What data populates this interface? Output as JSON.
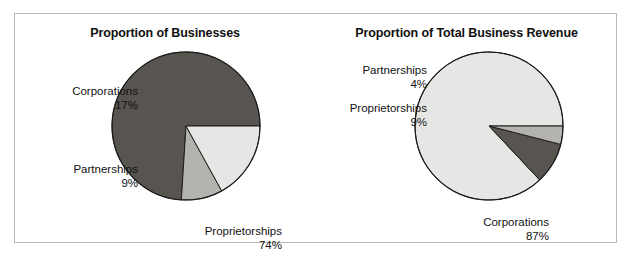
{
  "figure": {
    "background": "#ffffff",
    "frame_color": "#b9b9b9"
  },
  "chart_data": [
    {
      "type": "pie",
      "id": "proportion-of-businesses",
      "title": "Proportion of Businesses",
      "xlabel": "",
      "ylabel": "",
      "legend": "none (direct labels)",
      "grid": false,
      "categories": [
        "Proprietorships",
        "Partnerships",
        "Corporations"
      ],
      "values": [
        74,
        9,
        17
      ],
      "value_labels": [
        "74%",
        "9%",
        "17%"
      ],
      "units": "percent",
      "colors": [
        "#585450",
        "#b5b3b0",
        "#e6e6e4"
      ],
      "slices": [
        {
          "label": "Proprietorships",
          "value": 74,
          "value_label": "74%",
          "color": "#585450"
        },
        {
          "label": "Partnerships",
          "value": 9,
          "value_label": "9%",
          "color": "#b5b3b0"
        },
        {
          "label": "Corporations",
          "value": 17,
          "value_label": "17%",
          "color": "#e6e6e4"
        }
      ]
    },
    {
      "type": "pie",
      "id": "proportion-of-total-business-revenue",
      "title": "Proportion of Total Business Revenue",
      "xlabel": "",
      "ylabel": "",
      "legend": "none (direct labels)",
      "grid": false,
      "categories": [
        "Corporations",
        "Proprietorships",
        "Partnerships"
      ],
      "values": [
        87,
        9,
        4
      ],
      "value_labels": [
        "87%",
        "9%",
        "4%"
      ],
      "units": "percent",
      "colors": [
        "#e6e6e4",
        "#585450",
        "#b5b3b0"
      ],
      "slices": [
        {
          "label": "Corporations",
          "value": 87,
          "value_label": "87%",
          "color": "#e6e6e4"
        },
        {
          "label": "Proprietorships",
          "value": 9,
          "value_label": "9%",
          "color": "#585450"
        },
        {
          "label": "Partnerships",
          "value": 4,
          "value_label": "4%",
          "color": "#b5b3b0"
        }
      ]
    }
  ],
  "left_chart": {
    "title": "Proportion of Businesses",
    "callouts": {
      "corporations": {
        "name": "Corporations",
        "value": "17%"
      },
      "partnerships": {
        "name": "Partnerships",
        "value": "9%"
      },
      "proprietorships": {
        "name": "Proprietorships",
        "value": "74%"
      }
    }
  },
  "right_chart": {
    "title": "Proportion of Total Business Revenue",
    "callouts": {
      "partnerships": {
        "name": "Partnerships",
        "value": "4%"
      },
      "proprietorships": {
        "name": "Proprietorships",
        "value": "9%"
      },
      "corporations": {
        "name": "Corporations",
        "value": "87%"
      }
    }
  }
}
